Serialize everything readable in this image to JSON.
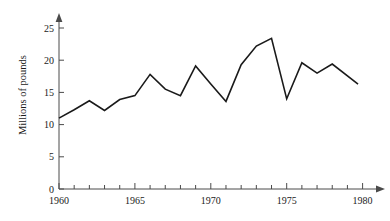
{
  "chart_data": {
    "type": "line",
    "title": "",
    "xlabel": "",
    "ylabel": "Millions of pounds",
    "xlim": [
      1960,
      1981
    ],
    "ylim": [
      0,
      26
    ],
    "grid": false,
    "legend": "none",
    "x": [
      1960,
      1961,
      1962,
      1963,
      1964,
      1965,
      1966,
      1967,
      1968,
      1969,
      1970,
      1971,
      1972,
      1973,
      1974,
      1975,
      1976,
      1977,
      1978,
      1979.7
    ],
    "values": [
      11.0,
      12.3,
      13.7,
      12.2,
      13.9,
      14.5,
      17.8,
      15.5,
      14.5,
      19.1,
      16.3,
      13.6,
      19.3,
      22.2,
      23.4,
      14.0,
      19.6,
      18.0,
      19.4,
      16.3
    ],
    "x_tick_labels": [
      "1960",
      "1965",
      "1970",
      "1975",
      "1980"
    ],
    "x_tick_values": [
      1960,
      1965,
      1970,
      1975,
      1980
    ],
    "x_minor_tick_values": [
      1961,
      1962,
      1963,
      1964,
      1966,
      1967,
      1968,
      1969,
      1971,
      1972,
      1973,
      1974,
      1976,
      1977,
      1978,
      1979
    ],
    "y_tick_labels": [
      "0",
      "5",
      "10",
      "15",
      "20",
      "25"
    ],
    "y_tick_values": [
      0,
      5,
      10,
      15,
      20,
      25
    ],
    "line_color": "#1a1a1a",
    "axis_color": "#4a4a4a",
    "background_color": "#ffffff"
  },
  "axes": {
    "y_axis_title": "Millions of pounds"
  }
}
